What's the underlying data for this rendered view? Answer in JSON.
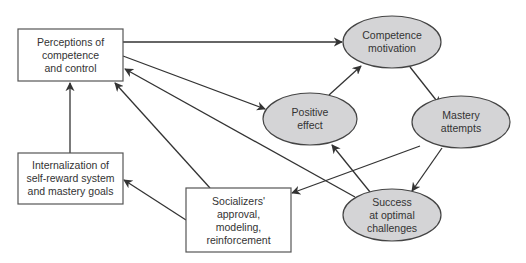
{
  "diagram": {
    "nodes": {
      "perceptions": {
        "shape": "rect",
        "lines": [
          "Perceptions of",
          "competence",
          "and control"
        ]
      },
      "internalization": {
        "shape": "rect",
        "lines": [
          "Internalization of",
          "self-reward system",
          "and mastery goals"
        ]
      },
      "socializers": {
        "shape": "rect",
        "lines": [
          "Socializers'",
          "approval,",
          "modeling,",
          "reinforcement"
        ]
      },
      "competence_motivation": {
        "shape": "ellipse",
        "lines": [
          "Competence",
          "motivation"
        ]
      },
      "positive_effect": {
        "shape": "ellipse",
        "lines": [
          "Positive",
          "effect"
        ]
      },
      "mastery_attempts": {
        "shape": "ellipse",
        "lines": [
          "Mastery",
          "attempts"
        ]
      },
      "success": {
        "shape": "ellipse",
        "lines": [
          "Success",
          "at optimal",
          "challenges"
        ]
      }
    },
    "edges": [
      {
        "from": "Perceptions of competence and control",
        "to": "Competence motivation"
      },
      {
        "from": "Perceptions of competence and control",
        "to": "Positive effect"
      },
      {
        "from": "Positive effect",
        "to": "Competence motivation"
      },
      {
        "from": "Competence motivation",
        "to": "Mastery attempts"
      },
      {
        "from": "Mastery attempts",
        "to": "Socializers' approval, modeling, reinforcement"
      },
      {
        "from": "Mastery attempts",
        "to": "Success at optimal challenges"
      },
      {
        "from": "Success at optimal challenges",
        "to": "Positive effect"
      },
      {
        "from": "Success at optimal challenges",
        "to": "Perceptions of competence and control"
      },
      {
        "from": "Socializers' approval, modeling, reinforcement",
        "to": "Perceptions of competence and control"
      },
      {
        "from": "Internalization of self-reward system and mastery goals",
        "to": "Perceptions of competence and control"
      },
      {
        "from": "Socializers' approval, modeling, reinforcement",
        "to": "Internalization of self-reward system and mastery goals"
      }
    ],
    "colors": {
      "ellipse_fill": "#d4d4d6",
      "stroke": "#444444",
      "text": "#333333",
      "background": "#ffffff"
    }
  }
}
